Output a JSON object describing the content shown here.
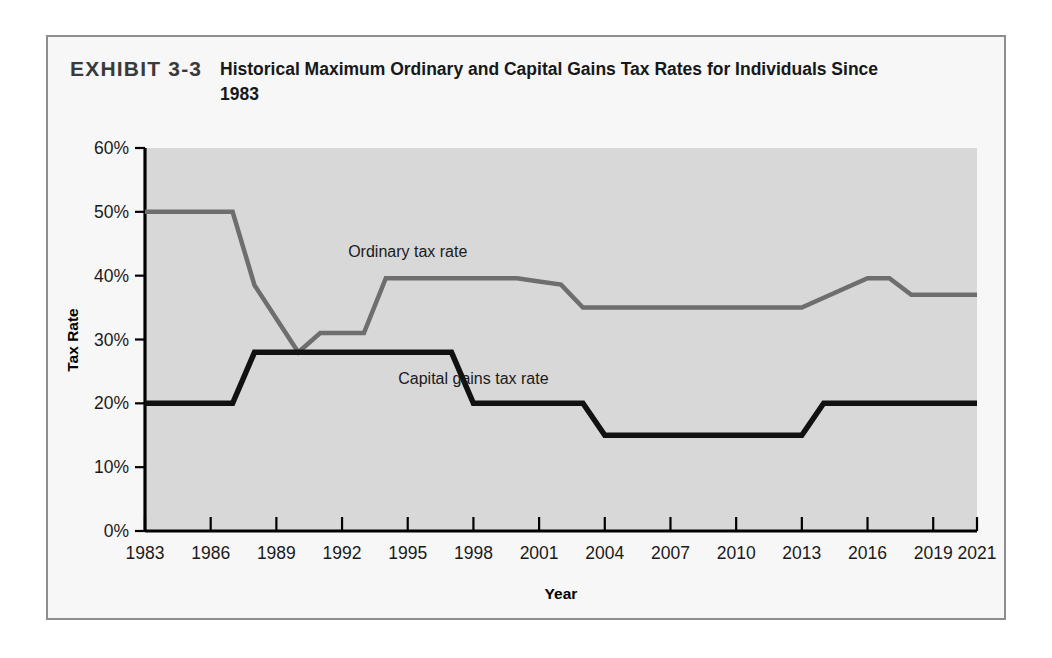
{
  "exhibit": {
    "number": "EXHIBIT 3-3",
    "title": "Historical Maximum Ordinary and Capital Gains Tax Rates for Individuals Since 1983"
  },
  "chart_data": {
    "type": "line",
    "title": "Historical Maximum Ordinary and Capital Gains Tax Rates for Individuals Since 1983",
    "xlabel": "Year",
    "ylabel": "Tax Rate",
    "xlim": [
      1983,
      2021
    ],
    "ylim": [
      0,
      60
    ],
    "ytick_labels": [
      "0%",
      "10%",
      "20%",
      "30%",
      "40%",
      "50%",
      "60%"
    ],
    "ytick_values": [
      0,
      10,
      20,
      30,
      40,
      50,
      60
    ],
    "xtick_labels": [
      "1983",
      "1986",
      "1989",
      "1992",
      "1995",
      "1998",
      "2001",
      "2004",
      "2007",
      "2010",
      "2013",
      "2016",
      "2019",
      "2021"
    ],
    "xtick_values": [
      1983,
      1986,
      1989,
      1992,
      1995,
      1998,
      2001,
      2004,
      2007,
      2010,
      2013,
      2016,
      2019,
      2021
    ],
    "grid": false,
    "legend_position": "inline-annotation",
    "plot_background": "#d8d8d8",
    "series": [
      {
        "name": "Ordinary tax rate",
        "color": "#6e6e6e",
        "label_x": 1995,
        "label_y": 43,
        "x": [
          1983,
          1987,
          1988,
          1990,
          1991,
          1992,
          1993,
          1994,
          2000,
          2001,
          2002,
          2003,
          2012,
          2013,
          2016,
          2017,
          2018,
          2021
        ],
        "values": [
          50,
          50,
          38.5,
          28,
          31,
          31,
          31,
          39.6,
          39.6,
          39.1,
          38.6,
          35,
          35,
          35,
          39.6,
          39.6,
          37,
          37
        ]
      },
      {
        "name": "Capital gains tax rate",
        "color": "#111111",
        "label_x": 1998,
        "label_y": 23,
        "x": [
          1983,
          1987,
          1988,
          1997,
          1998,
          2003,
          2004,
          2012,
          2013,
          2014,
          2021
        ],
        "values": [
          20,
          20,
          28,
          28,
          20,
          20,
          15,
          15,
          15,
          20,
          20
        ]
      }
    ]
  }
}
